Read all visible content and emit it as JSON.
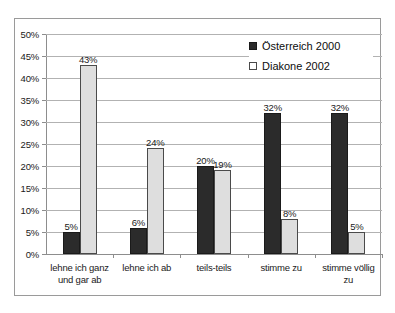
{
  "chart_data": {
    "type": "bar",
    "title": "",
    "xlabel": "",
    "ylabel": "",
    "ylim": [
      0,
      50
    ],
    "ytick_step": 5,
    "grid": true,
    "legend_position": "top-right",
    "categories": [
      "lehne ich ganz und gar ab",
      "lehne ich ab",
      "teils-teils",
      "stimme zu",
      "stimme völlig zu"
    ],
    "category_lines": [
      [
        "lehne ich ganz",
        "und gar ab"
      ],
      [
        "lehne ich ab"
      ],
      [
        "teils-teils"
      ],
      [
        "stimme zu"
      ],
      [
        "stimme völlig",
        "zu"
      ]
    ],
    "ytick_labels": [
      "0%",
      "5%",
      "10%",
      "15%",
      "20%",
      "25%",
      "30%",
      "35%",
      "40%",
      "45%",
      "50%"
    ],
    "ytick_values": [
      0,
      5,
      10,
      15,
      20,
      25,
      30,
      35,
      40,
      45,
      50
    ],
    "series": [
      {
        "name": "Österreich 2000",
        "color": "#2b2b2b",
        "values": [
          5,
          6,
          20,
          32,
          32
        ],
        "labels": [
          "5%",
          "6%",
          "20%",
          "32%",
          "32%"
        ]
      },
      {
        "name": "Diakone 2002",
        "color": "#dedede",
        "values": [
          43,
          24,
          19,
          8,
          5
        ],
        "labels": [
          "43%",
          "24%",
          "19%",
          "8%",
          "5%"
        ]
      }
    ]
  },
  "legend": {
    "items": [
      {
        "label": "Österreich 2000"
      },
      {
        "label": "Diakone 2002"
      }
    ]
  }
}
